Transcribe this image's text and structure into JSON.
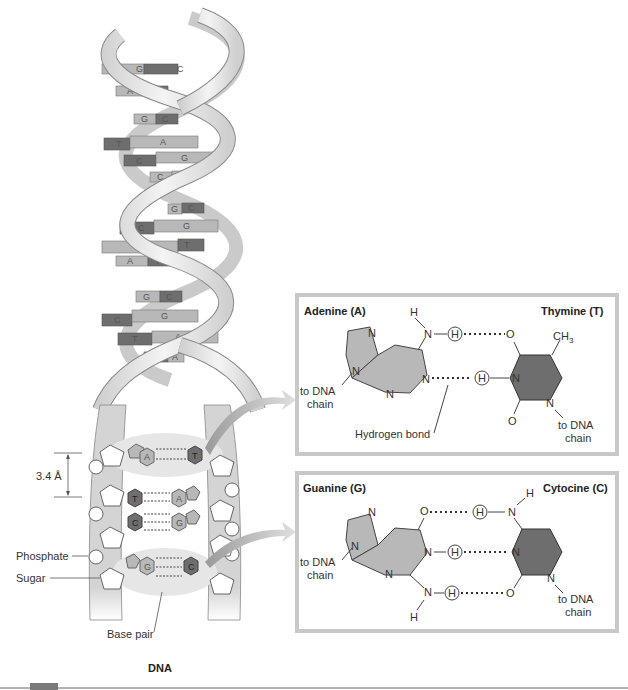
{
  "figure": {
    "caption": "DNA",
    "colors": {
      "strand": "#d9d9d9",
      "strand_edge": "#8a8a8a",
      "purine": "#b8b8b8",
      "pyrimidine": "#6e6e6e",
      "box_border": "#c8c8c8",
      "arrow": "#bdbdbd",
      "bottom_bar": "#7a7a7a"
    }
  },
  "helix": {
    "rungs": [
      {
        "left": "G",
        "right": "C"
      },
      {
        "left": "A",
        "right": "T"
      },
      {
        "left": "G",
        "right": "C"
      },
      {
        "left": "T",
        "right": "A"
      },
      {
        "left": "C",
        "right": "G"
      },
      {
        "left": "C",
        "right": "G"
      },
      {
        "left": "G",
        "right": "C"
      },
      {
        "left": "C",
        "right": "G"
      },
      {
        "left": "A",
        "right": "T"
      },
      {
        "left": "A",
        "right": "T"
      },
      {
        "left": "G",
        "right": "C"
      },
      {
        "left": "C",
        "right": "G"
      },
      {
        "left": "T",
        "right": "A"
      },
      {
        "left": "T",
        "right": "A"
      }
    ]
  },
  "ladder": {
    "pairs": [
      {
        "left": "A",
        "right": "T"
      },
      {
        "left": "T",
        "right": "A"
      },
      {
        "left": "C",
        "right": "G"
      },
      {
        "left": "G",
        "right": "C"
      }
    ],
    "labels": {
      "spacing": "3.4 Å",
      "phosphate": "Phosphate",
      "sugar": "Sugar",
      "base_pair": "Base pair"
    }
  },
  "at_box": {
    "left_title": "Adenine (A)",
    "right_title": "Thymine (T)",
    "methyl": "CH",
    "methyl_sub": "3",
    "to_chain_left_1": "to DNA",
    "to_chain_left_2": "chain",
    "to_chain_right_1": "to DNA",
    "to_chain_right_2": "chain",
    "hbond_label": "Hydrogen bond",
    "atoms": {
      "N": "N",
      "H": "H",
      "O": "O"
    }
  },
  "gc_box": {
    "left_title": "Guanine (G)",
    "right_title": "Cytocine (C)",
    "to_chain_left_1": "to DNA",
    "to_chain_left_2": "chain",
    "to_chain_right_1": "to DNA",
    "to_chain_right_2": "chain",
    "atoms": {
      "N": "N",
      "H": "H",
      "O": "O"
    }
  }
}
